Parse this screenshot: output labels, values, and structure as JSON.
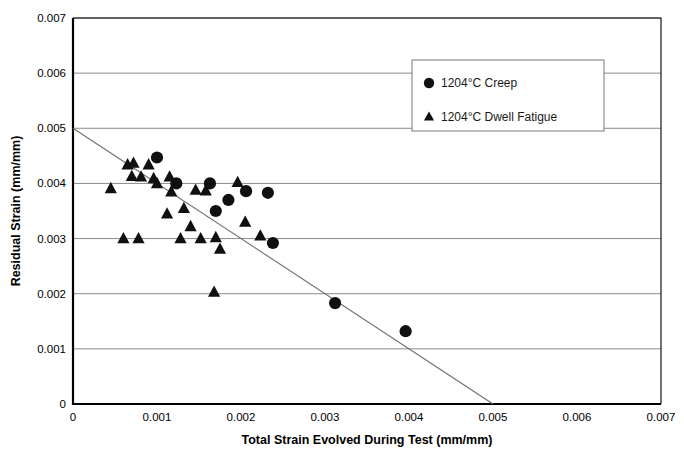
{
  "chart_data": {
    "type": "scatter",
    "title": "",
    "xlabel": "Total Strain Evolved During Test (mm/mm)",
    "ylabel": "Residual Strain (mm/mm)",
    "xlim": [
      0,
      0.007
    ],
    "ylim": [
      0,
      0.007
    ],
    "xticks": [
      "0",
      "0.001",
      "0.002",
      "0.003",
      "0.004",
      "0.005",
      "0.006",
      "0.007"
    ],
    "xtick_values": [
      0,
      0.001,
      0.002,
      0.003,
      0.004,
      0.005,
      0.006,
      0.007
    ],
    "yticks": [
      "0",
      "0.001",
      "0.002",
      "0.003",
      "0.004",
      "0.005",
      "0.006",
      "0.007"
    ],
    "ytick_values": [
      0,
      0.001,
      0.002,
      0.003,
      0.004,
      0.005,
      0.006,
      0.007
    ],
    "grid": "horizontal",
    "legend_position": "upper-right-inside",
    "marker_color": "#101010",
    "trendline_color": "#6e6e6e",
    "series": [
      {
        "name": "1204°C Creep",
        "marker": "circle",
        "points": [
          [
            0.001,
            0.00447
          ],
          [
            0.00123,
            0.004
          ],
          [
            0.00163,
            0.004
          ],
          [
            0.00185,
            0.0037
          ],
          [
            0.0017,
            0.0035
          ],
          [
            0.00206,
            0.00386
          ],
          [
            0.00232,
            0.00383
          ],
          [
            0.00238,
            0.00292
          ],
          [
            0.00312,
            0.00183
          ],
          [
            0.00396,
            0.00132
          ]
        ]
      },
      {
        "name": "1204°C Dwell Fatigue",
        "marker": "triangle",
        "points": [
          [
            0.00045,
            0.00391
          ],
          [
            0.00065,
            0.00434
          ],
          [
            0.00072,
            0.00437
          ],
          [
            0.0007,
            0.00413
          ],
          [
            0.00081,
            0.00412
          ],
          [
            0.0009,
            0.00434
          ],
          [
            0.00096,
            0.00409
          ],
          [
            0.001,
            0.004
          ],
          [
            0.0006,
            0.003
          ],
          [
            0.00078,
            0.003
          ],
          [
            0.00115,
            0.00412
          ],
          [
            0.00117,
            0.00385
          ],
          [
            0.00112,
            0.00345
          ],
          [
            0.00132,
            0.00355
          ],
          [
            0.0014,
            0.00322
          ],
          [
            0.00128,
            0.003
          ],
          [
            0.00146,
            0.00388
          ],
          [
            0.00158,
            0.00387
          ],
          [
            0.00152,
            0.003
          ],
          [
            0.0017,
            0.00302
          ],
          [
            0.00175,
            0.00281
          ],
          [
            0.00196,
            0.00402
          ],
          [
            0.00205,
            0.0033
          ],
          [
            0.00223,
            0.00305
          ],
          [
            0.00168,
            0.00203
          ]
        ]
      }
    ],
    "trendline": {
      "label": "",
      "x_start": 0,
      "y_start": 0.005,
      "x_end": 0.005,
      "y_end": 0
    }
  },
  "legend": {
    "entries": [
      {
        "label": "1204°C Creep",
        "marker": "circle"
      },
      {
        "label": "1204°C Dwell Fatigue",
        "marker": "triangle"
      }
    ]
  }
}
